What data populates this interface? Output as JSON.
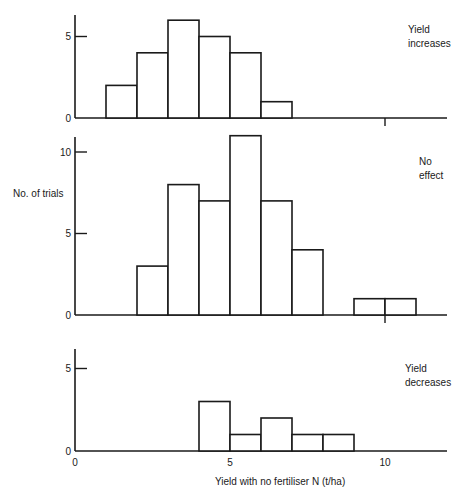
{
  "chart_data": {
    "type": "bar",
    "subtype": "histogram",
    "xlabel": "Yield with no fertiliser N (t/ha)",
    "ylabel": "No. of trials",
    "x_ticks": [
      0,
      5,
      10
    ],
    "xlim": [
      0,
      12
    ],
    "bin_width": 1,
    "panels": [
      {
        "name": "Yield increases",
        "label_lines": [
          "Yield",
          "increases"
        ],
        "ylim": [
          0,
          6
        ],
        "y_ticks": [
          0,
          5
        ],
        "bins": [
          {
            "x0": 1,
            "x1": 2,
            "count": 2
          },
          {
            "x0": 2,
            "x1": 3,
            "count": 4
          },
          {
            "x0": 3,
            "x1": 4,
            "count": 6
          },
          {
            "x0": 4,
            "x1": 5,
            "count": 5
          },
          {
            "x0": 5,
            "x1": 6,
            "count": 4
          },
          {
            "x0": 6,
            "x1": 7,
            "count": 1
          }
        ]
      },
      {
        "name": "No effect",
        "label_lines": [
          "No",
          "effect"
        ],
        "ylim": [
          0,
          11
        ],
        "y_ticks": [
          0,
          5,
          10
        ],
        "bins": [
          {
            "x0": 2,
            "x1": 3,
            "count": 3
          },
          {
            "x0": 3,
            "x1": 4,
            "count": 8
          },
          {
            "x0": 4,
            "x1": 5,
            "count": 7
          },
          {
            "x0": 5,
            "x1": 6,
            "count": 11
          },
          {
            "x0": 6,
            "x1": 7,
            "count": 7
          },
          {
            "x0": 7,
            "x1": 8,
            "count": 4
          },
          {
            "x0": 9,
            "x1": 10,
            "count": 1
          },
          {
            "x0": 10,
            "x1": 11,
            "count": 1
          }
        ]
      },
      {
        "name": "Yield decreases",
        "label_lines": [
          "Yield",
          "decreases"
        ],
        "ylim": [
          0,
          6
        ],
        "y_ticks": [
          0,
          5
        ],
        "bins": [
          {
            "x0": 4,
            "x1": 5,
            "count": 3
          },
          {
            "x0": 5,
            "x1": 6,
            "count": 1
          },
          {
            "x0": 6,
            "x1": 7,
            "count": 2
          },
          {
            "x0": 7,
            "x1": 8,
            "count": 1
          },
          {
            "x0": 8,
            "x1": 9,
            "count": 1
          }
        ]
      }
    ],
    "grid": false,
    "legend": "none"
  },
  "labels": {
    "ylabel": "No. of trials",
    "xlabel": "Yield with no fertiliser N (t/ha)"
  }
}
